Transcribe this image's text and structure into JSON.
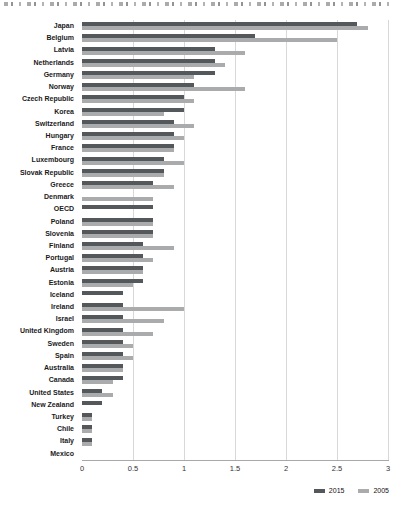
{
  "page": {
    "cropped_title_note": "top edge shows bottom slivers of a cropped title line (illegible)"
  },
  "chart_data": {
    "type": "bar",
    "orientation": "horizontal",
    "title": "",
    "xlabel": "",
    "ylabel": "",
    "xlim": [
      0,
      3
    ],
    "xticks": [
      "0",
      "0.5",
      "1",
      "1.5",
      "2",
      "2.5",
      "3"
    ],
    "grid": "vertical",
    "legend_position": "bottom-right",
    "categories": [
      "Japan",
      "Belgium",
      "Latvia",
      "Netherlands",
      "Germany",
      "Norway",
      "Czech Republic",
      "Korea",
      "Switzerland",
      "Hungary",
      "France",
      "Luxembourg",
      "Slovak Republic",
      "Greece",
      "Denmark",
      "OECD",
      "Poland",
      "Slovenia",
      "Finland",
      "Portugal",
      "Austria",
      "Estonia",
      "Iceland",
      "Ireland",
      "Israel",
      "United Kingdom",
      "Sweden",
      "Spain",
      "Australia",
      "Canada",
      "United States",
      "New Zealand",
      "Turkey",
      "Chile",
      "Italy",
      "Mexico"
    ],
    "series": [
      {
        "name": "2015",
        "color": "#54585b",
        "values": [
          2.7,
          1.7,
          1.3,
          1.3,
          1.3,
          1.1,
          1.0,
          1.0,
          0.9,
          0.9,
          0.9,
          0.8,
          0.8,
          0.7,
          null,
          0.7,
          0.7,
          0.7,
          0.6,
          0.6,
          0.6,
          0.6,
          0.4,
          0.4,
          0.4,
          0.4,
          0.4,
          0.4,
          0.4,
          0.4,
          0.2,
          0.2,
          0.1,
          0.1,
          0.1,
          0
        ]
      },
      {
        "name": "2005",
        "color": "#a9abad",
        "values": [
          2.8,
          2.5,
          1.6,
          1.4,
          1.1,
          1.6,
          1.1,
          0.8,
          1.1,
          1.0,
          0.9,
          1.0,
          0.8,
          0.9,
          0.7,
          null,
          0.7,
          0.7,
          0.9,
          0.7,
          0.6,
          0.5,
          null,
          1.0,
          0.8,
          0.7,
          0.5,
          0.5,
          0.4,
          0.3,
          0.3,
          null,
          0.1,
          0.1,
          0.1,
          0
        ]
      }
    ]
  }
}
